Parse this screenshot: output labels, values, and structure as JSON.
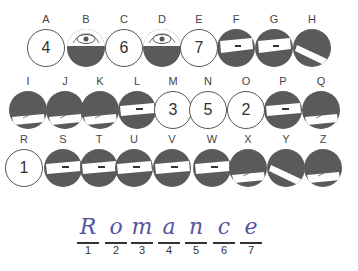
{
  "rows": [
    {
      "items": [
        {
          "letter": "A",
          "type": "number",
          "value": "4",
          "x": 24,
          "y": 12
        },
        {
          "letter": "B",
          "type": "eye",
          "x": 64,
          "y": 12
        },
        {
          "letter": "C",
          "type": "number",
          "value": "6",
          "x": 102,
          "y": 12
        },
        {
          "letter": "D",
          "type": "eye",
          "x": 140,
          "y": 12
        },
        {
          "letter": "E",
          "type": "number",
          "value": "7",
          "x": 177,
          "y": 12
        },
        {
          "letter": "F",
          "type": "band-high",
          "x": 214,
          "y": 12
        },
        {
          "letter": "G",
          "type": "band-high",
          "x": 252,
          "y": 12
        },
        {
          "letter": "H",
          "type": "band-diag",
          "x": 290,
          "y": 12
        }
      ]
    },
    {
      "items": [
        {
          "letter": "I",
          "type": "band-low",
          "x": 6,
          "y": 74
        },
        {
          "letter": "J",
          "type": "band-low",
          "x": 43,
          "y": 74
        },
        {
          "letter": "K",
          "type": "band-low",
          "x": 78,
          "y": 74
        },
        {
          "letter": "L",
          "type": "band-mid",
          "x": 115,
          "y": 74
        },
        {
          "letter": "M",
          "type": "number",
          "value": "3",
          "x": 151,
          "y": 74
        },
        {
          "letter": "N",
          "type": "number",
          "value": "5",
          "x": 186,
          "y": 74
        },
        {
          "letter": "O",
          "type": "number",
          "value": "2",
          "x": 224,
          "y": 74
        },
        {
          "letter": "P",
          "type": "band-mid",
          "x": 261,
          "y": 74
        },
        {
          "letter": "Q",
          "type": "band-low",
          "x": 299,
          "y": 74
        }
      ]
    },
    {
      "items": [
        {
          "letter": "R",
          "type": "number",
          "value": "1",
          "x": 2,
          "y": 132
        },
        {
          "letter": "S",
          "type": "band-mid",
          "x": 41,
          "y": 132
        },
        {
          "letter": "T",
          "type": "band-mid",
          "x": 77,
          "y": 132
        },
        {
          "letter": "U",
          "type": "band-mid",
          "x": 112,
          "y": 132
        },
        {
          "letter": "V",
          "type": "band-mid",
          "x": 150,
          "y": 132
        },
        {
          "letter": "W",
          "type": "band-mid",
          "x": 190,
          "y": 132
        },
        {
          "letter": "X",
          "type": "band-low",
          "x": 226,
          "y": 132
        },
        {
          "letter": "Y",
          "type": "band-diag",
          "x": 264,
          "y": 132
        },
        {
          "letter": "Z",
          "type": "band-low",
          "x": 301,
          "y": 132
        }
      ]
    }
  ],
  "answer": {
    "letters": [
      {
        "char": "R",
        "index": "1",
        "x": 0
      },
      {
        "char": "o",
        "index": "2",
        "x": 28
      },
      {
        "char": "m",
        "index": "3",
        "x": 54
      },
      {
        "char": "a",
        "index": "4",
        "x": 81
      },
      {
        "char": "n",
        "index": "5",
        "x": 108
      },
      {
        "char": "c",
        "index": "6",
        "x": 136
      },
      {
        "char": "e",
        "index": "7",
        "x": 163
      }
    ]
  },
  "colors": {
    "disc_dark": "#5a5a5a",
    "ink": "#55559a"
  }
}
